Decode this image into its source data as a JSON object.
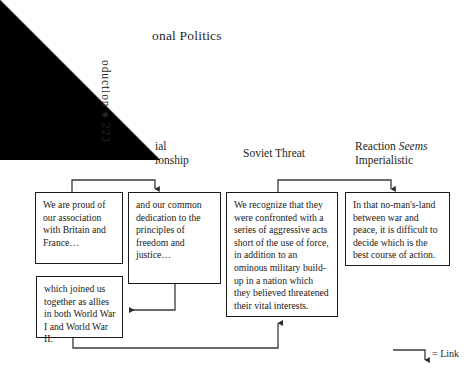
{
  "page": {
    "running_head": "onal Politics",
    "folio_margin_text": "oduction  ●  223",
    "folio_number": "223"
  },
  "columns": [
    {
      "id": "relationship",
      "label": "ial\nionship"
    },
    {
      "id": "soviet",
      "label": "Soviet Threat"
    },
    {
      "id": "reaction",
      "label_prefix": "Reaction ",
      "label_italic": "Seems",
      "label_suffix": " Imperialistic"
    }
  ],
  "nodes": [
    {
      "id": "proud",
      "text": "We are proud of our association with Britain and France…"
    },
    {
      "id": "dedication",
      "text": "and our common dedication to the principles of freedom and justice…"
    },
    {
      "id": "recognize",
      "text": "We recognize that they were confronted with a series of aggressive acts short of the use of force, in addition to an ominous military build-up in a nation which they believed threatened their vital interests."
    },
    {
      "id": "nomansland",
      "text": "In that no-man's-land between war and peace, it is difficult to decide which is the best course of action."
    },
    {
      "id": "allies",
      "text": "which joined us together as allies in both World War I and World War II."
    }
  ],
  "links": [
    {
      "from": "proud",
      "to": "dedication"
    },
    {
      "from": "dedication",
      "to": "allies"
    },
    {
      "from": "allies",
      "to": "recognize"
    },
    {
      "from": "recognize",
      "to": "nomansland"
    }
  ],
  "legend": {
    "label": "= Link"
  },
  "colors": {
    "ink": "#231f1d",
    "line": "#3a3a3a",
    "border": "#1a1a1a",
    "page": "#ffffff",
    "corner": "#000000"
  }
}
